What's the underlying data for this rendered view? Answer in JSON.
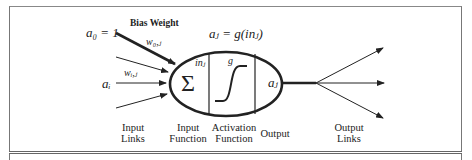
{
  "diagram": {
    "bias_label": "Bias Weight",
    "bias_input": "a₀ = 1",
    "bias_weight": "w₀,ⱼ",
    "input_weight": "wᵢ,ⱼ",
    "input_activation": "aᵢ",
    "output_equation": "aⱼ = g(inⱼ)",
    "sum_symbol": "Σ",
    "in_label": "inⱼ",
    "g_label": "g",
    "output_activation": "aⱼ",
    "bottom_labels": {
      "input_links": [
        "Input",
        "Links"
      ],
      "input_function": [
        "Input",
        "Function"
      ],
      "activation_function": [
        "Activation",
        "Function"
      ],
      "output": [
        "Output"
      ],
      "output_links": [
        "Output",
        "Links"
      ]
    },
    "colors": {
      "stroke": "#222222",
      "background": "#ffffff",
      "frame": "#777777"
    }
  }
}
